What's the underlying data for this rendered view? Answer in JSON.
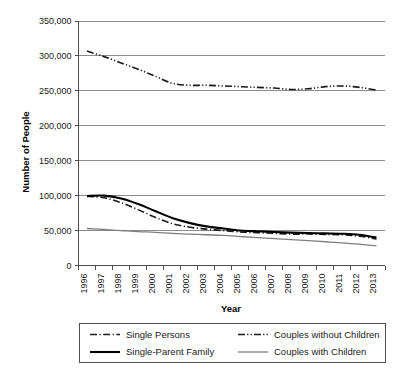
{
  "chart_data": {
    "type": "line",
    "title": "",
    "xlabel": "Year",
    "ylabel": "Number of People",
    "x": [
      1996,
      1997,
      1998,
      1999,
      2000,
      2001,
      2002,
      2003,
      2004,
      2005,
      2006,
      2007,
      2008,
      2009,
      2010,
      2011,
      2012,
      2013
    ],
    "categories": [
      "1996",
      "1997",
      "1998",
      "1999",
      "2000",
      "2001",
      "2002",
      "2003",
      "2004",
      "2005",
      "2006",
      "2007",
      "2008",
      "2009",
      "2010",
      "2011",
      "2012",
      "2013"
    ],
    "ylim": [
      0,
      350000
    ],
    "yticks": [
      0,
      50000,
      100000,
      150000,
      200000,
      250000,
      300000,
      350000
    ],
    "ytick_labels": [
      "0",
      "50,000",
      "100,000",
      "150,000",
      "200,000",
      "250,000",
      "300,000",
      "350,000"
    ],
    "grid": true,
    "legend_position": "bottom",
    "series": [
      {
        "name": "Single Persons",
        "style": "dash-dot",
        "color": "#1a1a1a",
        "width": 1.6,
        "dasharray": "7,2.5,1.2,2.5",
        "values": [
          99000,
          97000,
          90000,
          80000,
          69000,
          60000,
          55000,
          52000,
          50000,
          48000,
          47000,
          46000,
          45000,
          45000,
          44500,
          44000,
          42000,
          38000
        ]
      },
      {
        "name": "Couples without Children",
        "style": "dash-dot-dot",
        "color": "#1a1a1a",
        "width": 1.6,
        "dasharray": "7,2.2,1.2,2.2,1.2,2.2",
        "values": [
          307000,
          299000,
          290000,
          281000,
          271000,
          261000,
          258000,
          258000,
          257000,
          256000,
          255000,
          254000,
          252000,
          253000,
          256000,
          257000,
          255000,
          251000
        ]
      },
      {
        "name": "Single-Parent Family",
        "style": "solid",
        "color": "#000000",
        "width": 2.1,
        "dasharray": "",
        "values": [
          99500,
          100000,
          96000,
          88000,
          78000,
          68000,
          61000,
          56000,
          53000,
          50000,
          49000,
          48000,
          47000,
          46500,
          46000,
          45500,
          44000,
          40000
        ]
      },
      {
        "name": "Couples with Children",
        "style": "solid-thin",
        "color": "#7f7f7f",
        "width": 1.3,
        "dasharray": "",
        "values": [
          53000,
          51500,
          50000,
          48500,
          47500,
          46000,
          45000,
          44000,
          43000,
          41500,
          40000,
          38500,
          37000,
          35500,
          34000,
          32500,
          30500,
          28000
        ]
      }
    ]
  },
  "legend": {
    "items": [
      {
        "label": "Single Persons",
        "series_index": 0
      },
      {
        "label": "Couples without Children",
        "series_index": 1
      },
      {
        "label": "Single-Parent Family",
        "series_index": 2
      },
      {
        "label": "Couples with Children",
        "series_index": 3
      }
    ]
  },
  "colors": {
    "grid": "#808080",
    "axis": "#4d4d4d",
    "text": "#1a1a1a",
    "background": "#ffffff"
  }
}
